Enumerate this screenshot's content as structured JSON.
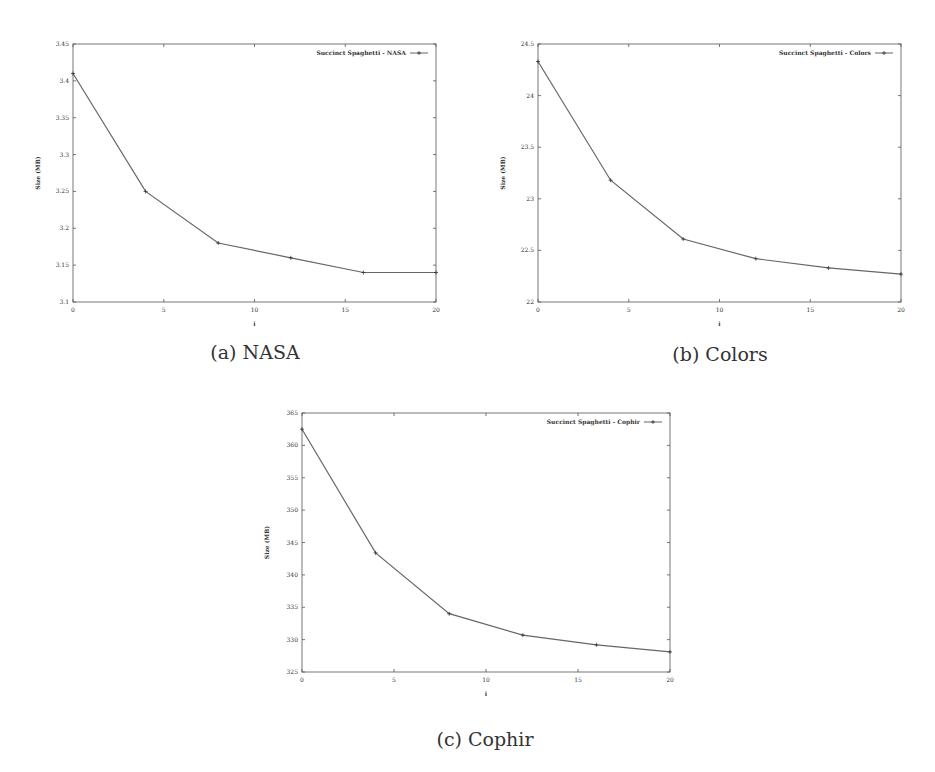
{
  "chart_data": [
    {
      "id": "nasa",
      "type": "line",
      "caption": "(a) NASA",
      "xlabel": "i",
      "ylabel": "Size (MB)",
      "xlim": [
        0,
        20
      ],
      "ylim": [
        3.1,
        3.45
      ],
      "xticks": [
        0,
        5,
        10,
        15,
        20
      ],
      "yticks": [
        3.1,
        3.15,
        3.2,
        3.25,
        3.3,
        3.35,
        3.4,
        3.45
      ],
      "ytick_labels": [
        "3.1",
        "3.15",
        "3.2",
        "3.25",
        "3.3",
        "3.35",
        "3.4",
        "3.45"
      ],
      "grid": false,
      "legend_position": "top-right",
      "series": [
        {
          "name": "Succinct Spaghetti - NASA",
          "x": [
            0,
            4,
            8,
            12,
            16,
            20
          ],
          "values": [
            3.41,
            3.25,
            3.18,
            3.16,
            3.14,
            3.14
          ]
        }
      ]
    },
    {
      "id": "colors",
      "type": "line",
      "caption": "(b) Colors",
      "xlabel": "i",
      "ylabel": "Size (MB)",
      "xlim": [
        0,
        20
      ],
      "ylim": [
        22,
        24.5
      ],
      "xticks": [
        0,
        5,
        10,
        15,
        20
      ],
      "yticks": [
        22,
        22.5,
        23,
        23.5,
        24,
        24.5
      ],
      "ytick_labels": [
        "22",
        "22.5",
        "23",
        "23.5",
        "24",
        "24.5"
      ],
      "grid": false,
      "legend_position": "top-right",
      "series": [
        {
          "name": "Succinct Spaghetti - Colors",
          "x": [
            0,
            4,
            8,
            12,
            16,
            20
          ],
          "values": [
            24.33,
            23.18,
            22.61,
            22.42,
            22.33,
            22.27
          ]
        }
      ]
    },
    {
      "id": "cophir",
      "type": "line",
      "caption": "(c) Cophir",
      "xlabel": "i",
      "ylabel": "Size (MB)",
      "xlim": [
        0,
        20
      ],
      "ylim": [
        325,
        365
      ],
      "xticks": [
        0,
        5,
        10,
        15,
        20
      ],
      "yticks": [
        325,
        330,
        335,
        340,
        345,
        350,
        355,
        360,
        365
      ],
      "ytick_labels": [
        "325",
        "330",
        "335",
        "340",
        "345",
        "350",
        "355",
        "360",
        "365"
      ],
      "grid": false,
      "legend_position": "top-right",
      "series": [
        {
          "name": "Succinct Spaghetti - Cophir",
          "x": [
            0,
            4,
            8,
            12,
            16,
            20
          ],
          "values": [
            362.5,
            343.4,
            334.0,
            330.7,
            329.2,
            328.1
          ]
        }
      ]
    }
  ],
  "layout": {
    "panels": [
      {
        "chart": 0,
        "plot": {
          "left": 73,
          "top": 44,
          "right": 436,
          "bottom": 302
        },
        "caption_x": 255,
        "caption_y": 341
      },
      {
        "chart": 1,
        "plot": {
          "left": 538,
          "top": 44,
          "right": 901,
          "bottom": 302
        },
        "caption_x": 720,
        "caption_y": 343
      },
      {
        "chart": 2,
        "plot": {
          "left": 302,
          "top": 413,
          "right": 670,
          "bottom": 672
        },
        "caption_x": 485,
        "caption_y": 728
      }
    ]
  },
  "colors": {
    "line": "#666666",
    "axis": "#555555",
    "text": "#333333"
  }
}
